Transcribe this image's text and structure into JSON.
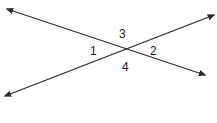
{
  "diagram": {
    "title": "",
    "line_color": "#2a2a2a",
    "lines": [
      {
        "name": "line-a",
        "x1": 7,
        "y1": 9,
        "x2": 205,
        "y2": 75
      },
      {
        "name": "line-b",
        "x1": 5,
        "y1": 96,
        "x2": 214,
        "y2": 15
      }
    ],
    "angle_labels": {
      "angle_1": "1",
      "angle_2": "2",
      "angle_3": "3",
      "angle_4": "4"
    }
  }
}
